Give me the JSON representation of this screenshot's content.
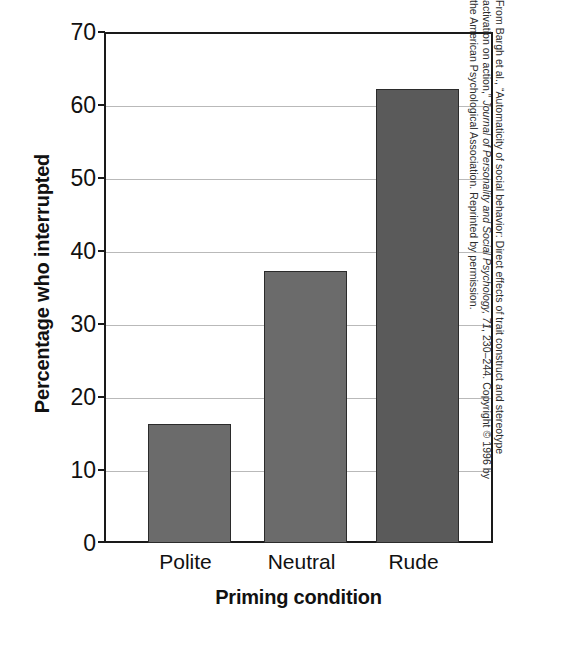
{
  "chart_data": {
    "type": "bar",
    "title": "",
    "categories": [
      "Polite",
      "Neutral",
      "Rude"
    ],
    "values": [
      16.3,
      37.2,
      62.2
    ],
    "xlabel": "Priming condition",
    "ylabel": "Percentage who interrupted",
    "ylim": [
      0,
      70
    ],
    "yticks": [
      0,
      10,
      20,
      30,
      40,
      50,
      60,
      70
    ],
    "ytick_labels": [
      "0",
      "10",
      "20",
      "30",
      "40",
      "50",
      "60",
      "70"
    ],
    "grid": true,
    "legend": "none",
    "bar_colors": [
      "#6b6b6b",
      "#6b6b6b",
      "#5a5a5a"
    ],
    "bar_edge_color": "#2b2b2b",
    "axis_color": "#1a1a1a",
    "gridline_color": "#b9b9b9",
    "background": "#ffffff"
  },
  "axes": {
    "y_title": "Percentage who interrupted",
    "x_title": "Priming condition",
    "y_tick_0": "0",
    "y_tick_10": "10",
    "y_tick_20": "20",
    "y_tick_30": "30",
    "y_tick_40": "40",
    "y_tick_50": "50",
    "y_tick_60": "60",
    "y_tick_70": "70",
    "x_tick_0": "Polite",
    "x_tick_1": "Neutral",
    "x_tick_2": "Rude"
  },
  "credit": {
    "line1": "From Bargh et al., “Automaticity of social behavior: Direct effects of trait construct and stereotype",
    "line2_a": "activation on action,” ",
    "line2_b": "Journal of Personality and Social Psychology, 71",
    "line2_c": ", 230–244. Copyright © 1996 by",
    "line3": "the American Psychological Association. Reprinted by permission."
  }
}
